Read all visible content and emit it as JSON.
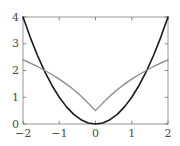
{
  "chart_data": {
    "type": "line",
    "title": "",
    "subtitle": "",
    "xlabel": "",
    "ylabel": "",
    "xlim": [
      -2,
      2
    ],
    "ylim": [
      0,
      4
    ],
    "grid": false,
    "legend": "none",
    "frame": "box",
    "background": "#ffffff",
    "xticks": [
      -2,
      -1,
      0,
      1,
      2
    ],
    "xticklabels": [
      "−2",
      "−1",
      "0",
      "1",
      "2"
    ],
    "yticks": [
      0,
      1,
      2,
      3,
      4
    ],
    "yticklabels": [
      "0",
      "1",
      "2",
      "3",
      "4"
    ],
    "series": [
      {
        "name": "parabola",
        "color": "#1a1a1a",
        "linewidth": 1.6,
        "x": [
          -2,
          -1.8,
          -1.6,
          -1.4,
          -1.2,
          -1,
          -0.8,
          -0.6,
          -0.4,
          -0.2,
          0,
          0.2,
          0.4,
          0.6,
          0.8,
          1,
          1.2,
          1.4,
          1.6,
          1.8,
          2
        ],
        "values": [
          4,
          3.24,
          2.56,
          1.96,
          1.44,
          1,
          0.64,
          0.36,
          0.16,
          0.04,
          0,
          0.04,
          0.16,
          0.36,
          0.64,
          1,
          1.44,
          1.96,
          2.56,
          3.24,
          4
        ]
      },
      {
        "name": "kinked-curve",
        "color": "#8c8c8c",
        "linewidth": 1.4,
        "x": [
          -2,
          -1.8,
          -1.6,
          -1.4,
          -1.2,
          -1,
          -0.8,
          -0.6,
          -0.4,
          -0.2,
          0,
          0.2,
          0.4,
          0.6,
          0.8,
          1,
          1.2,
          1.4,
          1.6,
          1.8,
          2
        ],
        "values": [
          2.4,
          2.28,
          2.15,
          2.0,
          1.85,
          1.68,
          1.49,
          1.28,
          1.05,
          0.78,
          0.5,
          0.78,
          1.05,
          1.28,
          1.49,
          1.68,
          1.85,
          2.0,
          2.15,
          2.28,
          2.4
        ]
      }
    ],
    "annotations": [],
    "crossings": [
      -1.45,
      1.45
    ],
    "axis_color": "#7a7a7a",
    "tick_color": "#7a7a7a",
    "label_color": "#4a4a4a"
  }
}
